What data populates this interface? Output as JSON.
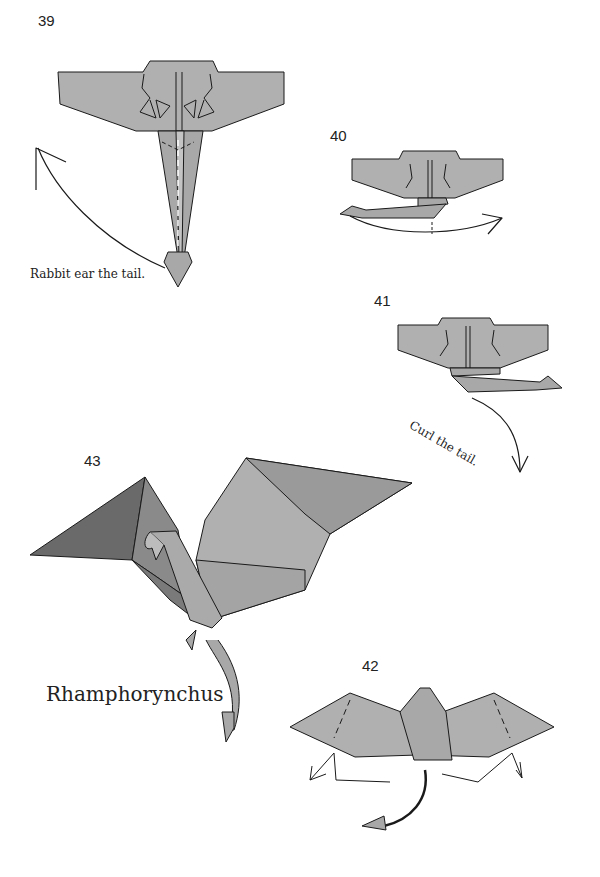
{
  "steps": [
    {
      "number": "39",
      "instruction": "Rabbit ear the tail."
    },
    {
      "number": "40",
      "instruction": ""
    },
    {
      "number": "41",
      "instruction": "Curl the tail."
    },
    {
      "number": "42",
      "instruction": ""
    },
    {
      "number": "43",
      "instruction": ""
    }
  ],
  "model_name": "Rhamphorynchus",
  "colors": {
    "paper_light": "#b2b2b2",
    "paper_mid": "#9a9a9a",
    "paper_dark": "#7a7a7a",
    "paper_darkest": "#6a6a6a",
    "line": "#1a1a1a",
    "background": "#ffffff"
  }
}
